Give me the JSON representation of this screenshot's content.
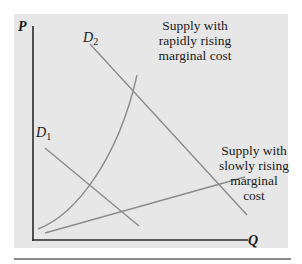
{
  "axes": {
    "y_label": "P",
    "x_label": "Q"
  },
  "curves": {
    "demand_1": {
      "name": "D",
      "subscript": "1"
    },
    "demand_2": {
      "name": "D",
      "subscript": "2"
    },
    "supply_rapid": {
      "label_lines": [
        "Supply with",
        "rapidly rising",
        "marginal cost"
      ]
    },
    "supply_slow": {
      "label_lines": [
        "Supply with",
        "slowly rising",
        "marginal",
        "cost"
      ]
    }
  },
  "colors": {
    "panel_bg": "#e7e7e7",
    "axis": "#2a2a2a",
    "curve": "#8c8c8c",
    "rule": "#8a8a8a"
  }
}
